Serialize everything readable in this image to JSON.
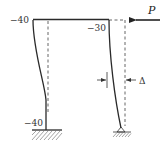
{
  "diagram": {
    "type": "portal-frame-deflection",
    "load": {
      "label": "P",
      "direction": "left"
    },
    "displacement": {
      "label": "Δ"
    },
    "moments": {
      "left_column_top": "−40",
      "right_column_top": "−30",
      "left_column_base": "−40"
    },
    "supports": {
      "left": "fixed",
      "right": "pinned"
    },
    "colors": {
      "line": "#2a2a2a",
      "dashed": "#555555",
      "hatch": "#666666"
    }
  }
}
